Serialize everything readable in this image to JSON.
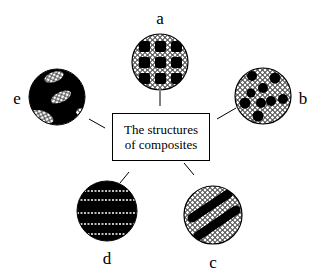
{
  "diagram": {
    "center_box": {
      "line1": "The structures",
      "line2": "of composites"
    },
    "nodes": [
      {
        "id": "a",
        "label": "a",
        "pattern": "dark square inclusions in 3x3 grid within light cellular matrix",
        "cx": 160,
        "cy": 62,
        "r": 28
      },
      {
        "id": "b",
        "label": "b",
        "pattern": "randomly dispersed dark particles in light cellular matrix",
        "cx": 263,
        "cy": 96,
        "r": 28
      },
      {
        "id": "c",
        "label": "c",
        "pattern": "two diagonal dark bands in light cellular matrix",
        "cx": 213,
        "cy": 215,
        "r": 29
      },
      {
        "id": "d",
        "label": "d",
        "pattern": "dark matrix with thin horizontal light layers",
        "cx": 107,
        "cy": 211,
        "r": 30
      },
      {
        "id": "e",
        "label": "e",
        "pattern": "dark matrix with scattered light cellular patches",
        "cx": 57,
        "cy": 97,
        "r": 28
      }
    ],
    "colors": {
      "ink": "#000000",
      "background": "#ffffff"
    }
  }
}
